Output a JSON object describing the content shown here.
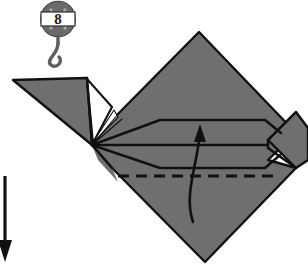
{
  "diagram": {
    "step_badge": {
      "icon": "pulley-hook-icon",
      "number": "8"
    },
    "colors": {
      "paper_fill": "#6f6f6f",
      "paper_fill_shadow": "#666565",
      "paper_stroke": "#111111",
      "background": "#ffffff",
      "badge_body": "#8a8a8a",
      "badge_dark": "#5e5e5e",
      "badge_band": "#ffffff",
      "arrow": "#111111"
    },
    "annotations": {
      "valley_fold_line": "dashed-fold-line",
      "fold_up_arrow": "curved-up-arrow",
      "turn_down_arrow": "straight-down-arrow"
    },
    "shapes": {
      "main_body": "large-gray-diamond",
      "left_wing": "left-triangular-flap",
      "right_point": "right-small-point",
      "neck_gap": "white-gap-triangle"
    }
  }
}
